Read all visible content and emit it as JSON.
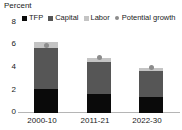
{
  "chart_data": {
    "type": "bar",
    "title": "Percent",
    "subtitle": "",
    "xlabel": "",
    "ylabel": "Percent",
    "categories": [
      "2000-10",
      "2011-21",
      "2022-30"
    ],
    "ylim": [
      0,
      8
    ],
    "yticks": [
      0,
      2,
      4,
      6,
      8
    ],
    "grid": false,
    "stacked": true,
    "legend_position": "top",
    "series": [
      {
        "name": "TFP",
        "values": [
          2.15,
          1.65,
          1.4
        ],
        "color": "#0a0a0a",
        "marker": "square"
      },
      {
        "name": "Capital",
        "values": [
          3.6,
          2.8,
          2.3
        ],
        "color": "#565656",
        "marker": "square"
      },
      {
        "name": "Labor",
        "values": [
          0.5,
          0.4,
          0.3
        ],
        "color": "#c4c4c4",
        "marker": "square"
      },
      {
        "name": "Potential growth",
        "values": [
          5.9,
          4.9,
          4.0
        ],
        "color": "#8c8c8c",
        "marker": "dot",
        "type": "point"
      }
    ]
  },
  "axis": {
    "title": "Percent",
    "ytick_labels": [
      "8",
      "6",
      "4",
      "2",
      "0"
    ],
    "xtick_labels": [
      "2000-10",
      "2011-21",
      "2022-30"
    ]
  },
  "legend": {
    "items": [
      {
        "label": "TFP",
        "icon": "square-swatch-black"
      },
      {
        "label": "Capital",
        "icon": "square-swatch-darkgray"
      },
      {
        "label": "Labor",
        "icon": "square-swatch-lightgray"
      },
      {
        "label": "Potential growth",
        "icon": "dot-marker-gray"
      }
    ]
  }
}
